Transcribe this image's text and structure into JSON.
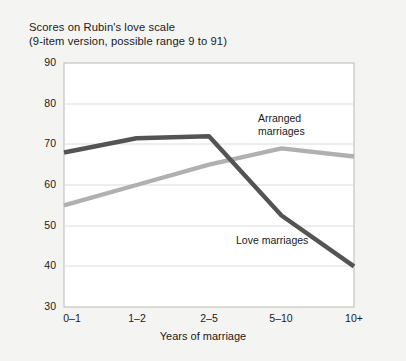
{
  "figure": {
    "background_color": "#f4f4f3",
    "plot_background_color": "#ffffff",
    "frame_color": "#b8b8b8",
    "grid_color": "#dcdcdc"
  },
  "title": {
    "line1": "Scores on Rubin's love scale",
    "line2": "(9-item version, possible range 9 to 91)"
  },
  "axes": {
    "x_title": "Years of marriage",
    "y_ticks": [
      "90",
      "80",
      "70",
      "60",
      "50",
      "40",
      "30"
    ],
    "x_ticks": [
      "0–1",
      "1–2",
      "2–5",
      "5–10",
      "10+"
    ]
  },
  "annotations": {
    "arranged_line1": "Arranged",
    "arranged_line2": "marriages",
    "love": "Love marriages"
  },
  "chart_data": {
    "type": "line",
    "title": "Scores on Rubin's love scale (9-item version, possible range 9 to 91)",
    "xlabel": "Years of marriage",
    "ylabel": "",
    "categories": [
      "0–1",
      "1–2",
      "2–5",
      "5–10",
      "10+"
    ],
    "ylim": [
      30,
      90
    ],
    "yticks": [
      30,
      40,
      50,
      60,
      70,
      80,
      90
    ],
    "grid": "horizontal",
    "legend": "inline-annotations",
    "series": [
      {
        "name": "Love marriages",
        "color": "#545454",
        "values": [
          68,
          71.5,
          72,
          52.5,
          40
        ]
      },
      {
        "name": "Arranged marriages",
        "color": "#b0b0b0",
        "values": [
          55,
          60,
          65,
          69,
          67
        ]
      }
    ]
  }
}
